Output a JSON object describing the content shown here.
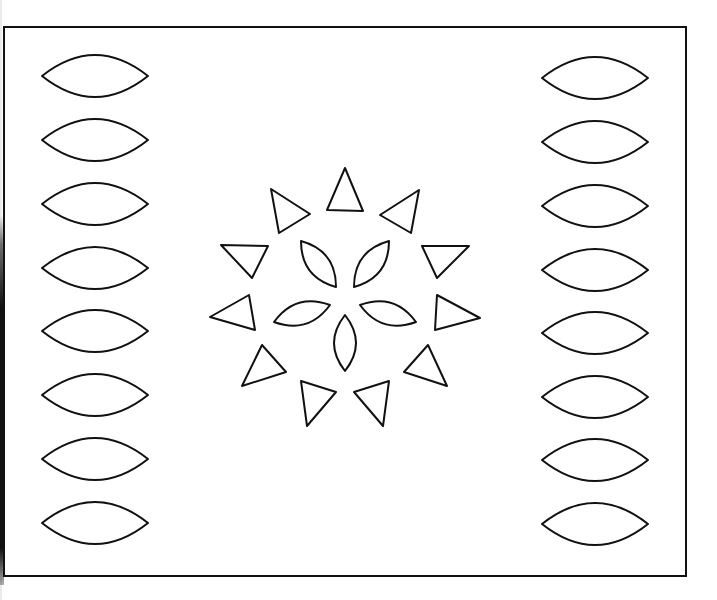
{
  "page": {
    "type": "coloring-page-pattern",
    "colors": {
      "background": "#ffffff",
      "line": "#111111"
    }
  },
  "frame": {
    "x": 4,
    "y": 27,
    "width": 682,
    "height": 549
  },
  "left_column": {
    "shape": "lens",
    "cx": 95,
    "rx": 53,
    "ry": 21,
    "centers_y": [
      76,
      140,
      204,
      268,
      331,
      395,
      459,
      523
    ]
  },
  "right_column": {
    "shape": "lens",
    "cx": 595,
    "rx": 53,
    "ry": 21,
    "centers_y": [
      78,
      142,
      206,
      270,
      333,
      397,
      460,
      524
    ]
  },
  "center_motif": {
    "petals": [
      {
        "name": "upper-left",
        "p1": [
          301,
          241
        ],
        "p2": [
          336,
          287
        ]
      },
      {
        "name": "upper-right",
        "p1": [
          389,
          241
        ],
        "p2": [
          354,
          287
        ]
      },
      {
        "name": "left",
        "p1": [
          274,
          322
        ],
        "p2": [
          330,
          305
        ]
      },
      {
        "name": "right",
        "p1": [
          360,
          305
        ],
        "p2": [
          416,
          322
        ]
      },
      {
        "name": "bottom",
        "p1": [
          345,
          315
        ],
        "p2": [
          345,
          371
        ]
      }
    ],
    "triangles": [
      [
        [
          345,
          168
        ],
        [
          327,
          210
        ],
        [
          363,
          211
        ]
      ],
      [
        [
          271,
          189
        ],
        [
          310,
          214
        ],
        [
          279,
          233
        ]
      ],
      [
        [
          419,
          190
        ],
        [
          380,
          215
        ],
        [
          411,
          233
        ]
      ],
      [
        [
          221,
          245
        ],
        [
          268,
          246
        ],
        [
          252,
          278
        ]
      ],
      [
        [
          422,
          246
        ],
        [
          469,
          246
        ],
        [
          437,
          278
        ]
      ],
      [
        [
          210,
          317
        ],
        [
          249,
          295
        ],
        [
          255,
          330
        ]
      ],
      [
        [
          437,
          295
        ],
        [
          480,
          318
        ],
        [
          435,
          330
        ]
      ],
      [
        [
          262,
          345
        ],
        [
          286,
          372
        ],
        [
          242,
          386
        ]
      ],
      [
        [
          428,
          345
        ],
        [
          447,
          386
        ],
        [
          404,
          372
        ]
      ],
      [
        [
          301,
          381
        ],
        [
          336,
          392
        ],
        [
          307,
          426
        ]
      ],
      [
        [
          354,
          392
        ],
        [
          389,
          381
        ],
        [
          383,
          426
        ]
      ]
    ]
  }
}
